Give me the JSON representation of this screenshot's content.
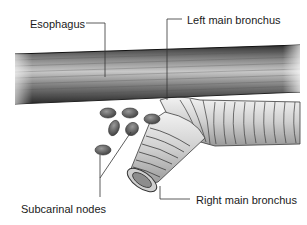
{
  "diagram": {
    "labels": {
      "esophagus": "Esophagus",
      "left_main_bronchus": "Left main bronchus",
      "subcarinal_nodes": "Subcarinal nodes",
      "right_main_bronchus": "Right main bronchus"
    },
    "colors": {
      "background": "#ffffff",
      "esophagus_dark": "#3a3a3a",
      "esophagus_light": "#bdbdbd",
      "bronchus_fill": "#d9d9d9",
      "bronchus_ring": "#3c3c3c",
      "node_fill": "#6b6b6b",
      "leader_line": "#333333"
    }
  }
}
